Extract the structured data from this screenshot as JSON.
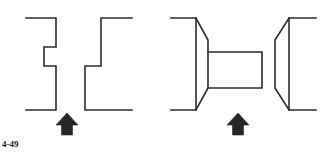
{
  "page": {
    "background_color": "#ffffff",
    "width": 321,
    "height": 158,
    "figure_label": "4-49"
  },
  "style": {
    "line_color": "#2b2b2b",
    "line_width": 1.6,
    "arrow_color": "#262626"
  },
  "figures": [
    {
      "name": "left-figure",
      "description": "Stepped block profile drawn as two separated Z-shaped outlines",
      "parts": [
        {
          "name": "left-profile-polyline",
          "points": "26,18 56,18 56,47 44,47 44,66 56,66 56,110 26,110"
        },
        {
          "name": "right-profile-polyline",
          "points": "132,18 101,18 101,66 85,66 85,110 132,110"
        }
      ],
      "arrow": {
        "name": "view-direction-arrow-left",
        "x": 67,
        "y": 124,
        "direction": "up"
      }
    },
    {
      "name": "right-figure",
      "description": "Spool / pulley profile drawn as two tapered flanges with a central rectangular hub",
      "parts": [
        {
          "name": "left-flange-polyline",
          "points": "171,18 196,18 208,40 208,88 196,110 171,110"
        },
        {
          "name": "left-flange-vertical",
          "points": "196,18 196,110"
        },
        {
          "name": "hub-rectangle-polyline",
          "points": "208,52 262,52 262,88 208,88"
        },
        {
          "name": "right-flange-polyline",
          "points": "316,18 289,18 275,40 275,88 289,110 316,110"
        },
        {
          "name": "right-flange-vertical",
          "points": "289,18 289,110"
        }
      ],
      "arrow": {
        "name": "view-direction-arrow-right",
        "x": 238,
        "y": 124,
        "direction": "up"
      }
    }
  ]
}
